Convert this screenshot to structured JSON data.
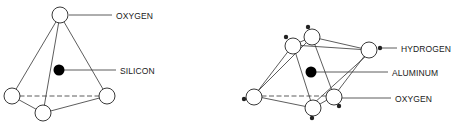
{
  "diagrams": [
    {
      "id": "silica-tetrahedron",
      "shape": "tetrahedron",
      "labels": {
        "top_atom": "OXYGEN",
        "center_atom": "SILICON"
      }
    },
    {
      "id": "alumina-octahedron",
      "shape": "octahedron",
      "labels": {
        "h_atom": "HYDROGEN",
        "center_atom": "ALUMINUM",
        "o_atom": "OXYGEN"
      }
    }
  ],
  "colors": {
    "oxygen_fill": "#ffffff",
    "center_fill": "#000000",
    "hydrogen_fill": "#222222",
    "line": "#333333"
  }
}
